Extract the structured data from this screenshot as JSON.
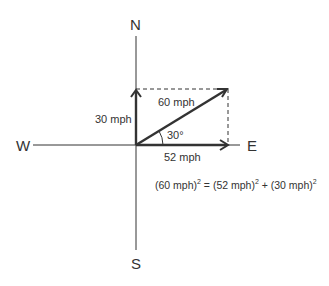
{
  "compass": {
    "north": "N",
    "south": "S",
    "east": "E",
    "west": "W"
  },
  "vectors": {
    "resultant": {
      "label": "60 mph",
      "magnitude": 60,
      "unit": "mph"
    },
    "east_component": {
      "label": "52 mph",
      "magnitude": 52,
      "unit": "mph"
    },
    "north_component": {
      "label": "30 mph",
      "magnitude": 30,
      "unit": "mph"
    }
  },
  "angle": {
    "label": "30°",
    "value": 30
  },
  "equation": {
    "lhs": "(60 mph)",
    "eq": " = ",
    "rhs1": "(52 mph)",
    "plus": " + ",
    "rhs2": "(30 mph)",
    "exp": "2"
  },
  "colors": {
    "line": "#333333",
    "text": "#333333",
    "background": "#ffffff"
  }
}
